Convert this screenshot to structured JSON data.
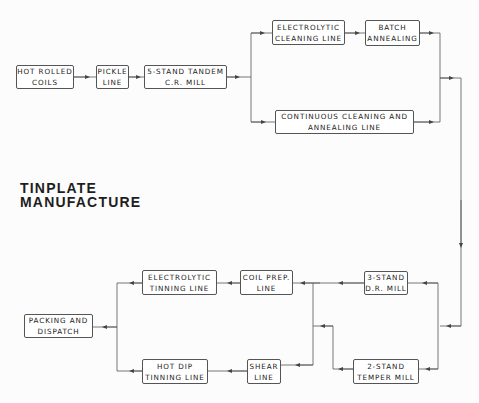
{
  "diagram": {
    "title": {
      "line1": "TINPLATE",
      "line2": "MANUFACTURE"
    },
    "nodes": {
      "hot_rolled_coils": {
        "line1": "HOT ROLLED",
        "line2": "COILS"
      },
      "pickle_line": {
        "line1": "PICKLE",
        "line2": "LINE"
      },
      "tandem_mill": {
        "line1": "5-STAND TANDEM",
        "line2": "C.R. MILL"
      },
      "electrolytic_cleaning": {
        "line1": "ELECTROLYTIC",
        "line2": "CLEANING  LINE"
      },
      "batch_annealing": {
        "line1": "BATCH",
        "line2": "ANNEALING"
      },
      "continuous_cleaning": {
        "line1": "CONTINUOUS  CLEANING  AND",
        "line2": "ANNEALING  LINE"
      },
      "dr_mill": {
        "line1": "3-STAND",
        "line2": "D.R. MILL"
      },
      "temper_mill": {
        "line1": "2-STAND",
        "line2": "TEMPER  MILL"
      },
      "coil_prep": {
        "line1": "COIL  PREP.",
        "line2": "LINE"
      },
      "shear_line": {
        "line1": "SHEAR",
        "line2": "LINE"
      },
      "electrolytic_tinning": {
        "line1": "ELECTROLYTIC",
        "line2": "TINNING   LINE"
      },
      "hot_dip_tinning": {
        "line1": "HOT  DIP",
        "line2": "TINNING LINE"
      },
      "packing_dispatch": {
        "line1": "PACKING  AND",
        "line2": "DISPATCH"
      }
    },
    "edges": [
      [
        "hot_rolled_coils",
        "pickle_line"
      ],
      [
        "pickle_line",
        "tandem_mill"
      ],
      [
        "tandem_mill",
        "electrolytic_cleaning"
      ],
      [
        "tandem_mill",
        "continuous_cleaning"
      ],
      [
        "electrolytic_cleaning",
        "batch_annealing"
      ],
      [
        "batch_annealing",
        "dr_mill"
      ],
      [
        "batch_annealing",
        "temper_mill"
      ],
      [
        "continuous_cleaning",
        "dr_mill"
      ],
      [
        "continuous_cleaning",
        "temper_mill"
      ],
      [
        "dr_mill",
        "coil_prep"
      ],
      [
        "temper_mill",
        "coil_prep"
      ],
      [
        "temper_mill",
        "shear_line"
      ],
      [
        "coil_prep",
        "electrolytic_tinning"
      ],
      [
        "shear_line",
        "hot_dip_tinning"
      ],
      [
        "electrolytic_tinning",
        "packing_dispatch"
      ],
      [
        "hot_dip_tinning",
        "packing_dispatch"
      ]
    ],
    "colors": {
      "line": "#555555",
      "text": "#222222",
      "background": "#fcfcfc"
    }
  }
}
